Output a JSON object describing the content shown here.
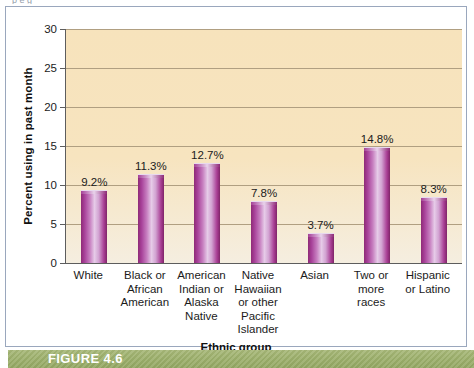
{
  "figure": {
    "caption_label": "FIGURE 4.6",
    "clipped_top_text": "p     e    g",
    "band_color": "#9db06c",
    "frame_color": "#9aa7bd"
  },
  "chart_data": {
    "type": "bar",
    "title": "",
    "xlabel": "Ethnic group",
    "ylabel": "Percent using in past month",
    "ylim": [
      0,
      30
    ],
    "ytick_values": [
      0,
      5,
      10,
      15,
      20,
      25,
      30
    ],
    "ytick_labels": [
      "0",
      "5",
      "10",
      "15",
      "20",
      "25",
      "30"
    ],
    "grid": true,
    "legend": "none",
    "plot_background": "#f7e3bc",
    "bar_color": "#a8429a",
    "categories": [
      "White",
      "Black or African American",
      "American Indian or Alaska Native",
      "Native Hawaiian or other Pacific Islander",
      "Asian",
      "Two or more races",
      "Hispanic or Latino"
    ],
    "category_lines": [
      [
        "White"
      ],
      [
        "Black or",
        "African",
        "American"
      ],
      [
        "American",
        "Indian or",
        "Alaska",
        "Native"
      ],
      [
        "Native",
        "Hawaiian",
        "or other",
        "Pacific",
        "Islander"
      ],
      [
        "Asian"
      ],
      [
        "Two or",
        "more",
        "races"
      ],
      [
        "Hispanic",
        "or Latino"
      ]
    ],
    "values": [
      9.2,
      11.3,
      12.7,
      7.8,
      3.7,
      14.8,
      8.3
    ],
    "value_labels": [
      "9.2%",
      "11.3%",
      "12.7%",
      "7.8%",
      "3.7%",
      "14.8%",
      "8.3%"
    ]
  }
}
